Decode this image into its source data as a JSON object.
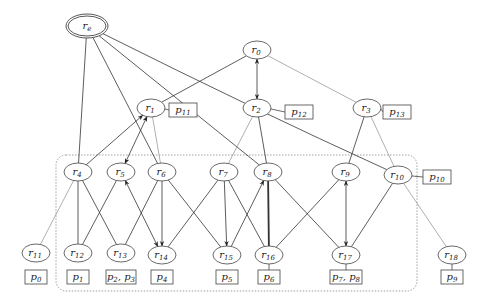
{
  "diagram": {
    "root": {
      "id": "re",
      "label": "r",
      "sub": "e",
      "x": 87,
      "y": 26
    },
    "nodes": [
      {
        "id": "r0",
        "label": "r",
        "sub": "0",
        "x": 257,
        "y": 50
      },
      {
        "id": "r1",
        "label": "r",
        "sub": "1",
        "x": 151,
        "y": 108
      },
      {
        "id": "r2",
        "label": "r",
        "sub": "2",
        "x": 257,
        "y": 108
      },
      {
        "id": "r3",
        "label": "r",
        "sub": "3",
        "x": 367,
        "y": 108
      },
      {
        "id": "r4",
        "label": "r",
        "sub": "4",
        "x": 78,
        "y": 172
      },
      {
        "id": "r5",
        "label": "r",
        "sub": "5",
        "x": 121,
        "y": 172
      },
      {
        "id": "r6",
        "label": "r",
        "sub": "6",
        "x": 162,
        "y": 172
      },
      {
        "id": "r7",
        "label": "r",
        "sub": "7",
        "x": 224,
        "y": 172
      },
      {
        "id": "r8",
        "label": "r",
        "sub": "8",
        "x": 268,
        "y": 172
      },
      {
        "id": "r9",
        "label": "r",
        "sub": "9",
        "x": 346,
        "y": 172
      },
      {
        "id": "r10",
        "label": "r",
        "sub": "10",
        "x": 398,
        "y": 175
      },
      {
        "id": "r11",
        "label": "r",
        "sub": "11",
        "x": 36,
        "y": 253
      },
      {
        "id": "r12",
        "label": "r",
        "sub": "12",
        "x": 78,
        "y": 253
      },
      {
        "id": "r13",
        "label": "r",
        "sub": "13",
        "x": 121,
        "y": 253
      },
      {
        "id": "r14",
        "label": "r",
        "sub": "14",
        "x": 162,
        "y": 255
      },
      {
        "id": "r15",
        "label": "r",
        "sub": "15",
        "x": 227,
        "y": 255
      },
      {
        "id": "r16",
        "label": "r",
        "sub": "16",
        "x": 269,
        "y": 255
      },
      {
        "id": "r17",
        "label": "r",
        "sub": "17",
        "x": 346,
        "y": 255
      },
      {
        "id": "r18",
        "label": "r",
        "sub": "18",
        "x": 452,
        "y": 255
      }
    ],
    "processors": [
      {
        "id": "p11",
        "text": "p",
        "sub": "11",
        "x": 183,
        "y": 110,
        "w": 28,
        "attach": "r1"
      },
      {
        "id": "p12",
        "text": "p",
        "sub": "12",
        "x": 299,
        "y": 112,
        "w": 28,
        "attach": "r2"
      },
      {
        "id": "p13",
        "text": "p",
        "sub": "13",
        "x": 397,
        "y": 112,
        "w": 28,
        "attach": "r3"
      },
      {
        "id": "p10",
        "text": "p",
        "sub": "10",
        "x": 437,
        "y": 177,
        "w": 28,
        "attach": "r10"
      },
      {
        "id": "p0",
        "text": "p",
        "sub": "0",
        "x": 36,
        "y": 277,
        "w": 22,
        "attach": null
      },
      {
        "id": "p1",
        "text": "p",
        "sub": "1",
        "x": 78,
        "y": 277,
        "w": 22,
        "attach": null
      },
      {
        "id": "p23",
        "text": "p",
        "sub": "2",
        "text2": ", p",
        "sub2": "3",
        "x": 121,
        "y": 277,
        "w": 30,
        "attach": null
      },
      {
        "id": "p4",
        "text": "p",
        "sub": "4",
        "x": 162,
        "y": 277,
        "w": 22,
        "attach": null
      },
      {
        "id": "p5",
        "text": "p",
        "sub": "5",
        "x": 227,
        "y": 277,
        "w": 22,
        "attach": null
      },
      {
        "id": "p6",
        "text": "p",
        "sub": "6",
        "x": 269,
        "y": 277,
        "w": 22,
        "attach": "r16"
      },
      {
        "id": "p78",
        "text": "p",
        "sub": "7",
        "text2": ", p",
        "sub2": "8",
        "x": 346,
        "y": 277,
        "w": 32,
        "attach": "r17"
      },
      {
        "id": "p9",
        "text": "p",
        "sub": "9",
        "x": 452,
        "y": 277,
        "w": 22,
        "attach": "r18"
      }
    ],
    "edges": [
      {
        "from": "re",
        "to": "r4",
        "style": "solid"
      },
      {
        "from": "re",
        "to": "r6",
        "style": "solid"
      },
      {
        "from": "re",
        "to": "r8",
        "style": "solid"
      },
      {
        "from": "re",
        "to": "r10",
        "style": "solid",
        "curve": true
      },
      {
        "from": "r0",
        "to": "r1",
        "style": "solid"
      },
      {
        "from": "r0",
        "to": "r2",
        "style": "solid",
        "arrow": "both"
      },
      {
        "from": "r0",
        "to": "r3",
        "style": "gray"
      },
      {
        "from": "r1",
        "to": "r6",
        "style": "gray"
      },
      {
        "from": "r4",
        "to": "r1",
        "style": "solid",
        "arrow": "end"
      },
      {
        "from": "r1",
        "to": "r5",
        "style": "solid",
        "arrow": "both"
      },
      {
        "from": "r2",
        "to": "r7",
        "style": "gray"
      },
      {
        "from": "r2",
        "to": "r8",
        "style": "solid"
      },
      {
        "from": "r3",
        "to": "r9",
        "style": "solid"
      },
      {
        "from": "r3",
        "to": "r10",
        "style": "gray"
      },
      {
        "from": "r4",
        "to": "r11",
        "style": "gray"
      },
      {
        "from": "r4",
        "to": "r12",
        "style": "solid"
      },
      {
        "from": "r4",
        "to": "r13",
        "style": "solid"
      },
      {
        "from": "r5",
        "to": "r12",
        "style": "solid"
      },
      {
        "from": "r5",
        "to": "r14",
        "style": "solid",
        "arrow": "both"
      },
      {
        "from": "r6",
        "to": "r13",
        "style": "solid"
      },
      {
        "from": "r6",
        "to": "r14",
        "style": "solid",
        "arrow": "end"
      },
      {
        "from": "r6",
        "to": "r15",
        "style": "solid"
      },
      {
        "from": "r7",
        "to": "r14",
        "style": "solid"
      },
      {
        "from": "r7",
        "to": "r15",
        "style": "solid",
        "arrow": "end"
      },
      {
        "from": "r7",
        "to": "r16",
        "style": "solid"
      },
      {
        "from": "r15",
        "to": "r8",
        "style": "solid",
        "arrow": "end"
      },
      {
        "from": "r16",
        "to": "r8",
        "style": "thick"
      },
      {
        "from": "r8",
        "to": "r17",
        "style": "solid"
      },
      {
        "from": "r9",
        "to": "r16",
        "style": "solid"
      },
      {
        "from": "r9",
        "to": "r17",
        "style": "solid",
        "arrow": "both"
      },
      {
        "from": "r10",
        "to": "r17",
        "style": "solid"
      },
      {
        "from": "r10",
        "to": "r18",
        "style": "gray"
      }
    ],
    "cluster": {
      "x": 56,
      "y": 155,
      "w": 361,
      "h": 136,
      "r": 10
    },
    "colors": {
      "line": "#333333",
      "gray": "#9a9a9a",
      "cluster": "#8a8a8a"
    }
  }
}
